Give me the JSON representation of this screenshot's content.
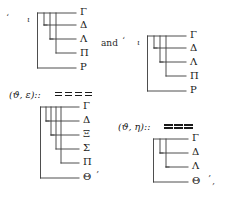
{
  "document": {
    "type": "mathematical-tree-diagrams",
    "conjunction": "and",
    "open_quote": "‘",
    "close_quote": "’",
    "trailing_comma": ",",
    "iota_symbol": "ι"
  },
  "formulas": [
    {
      "id": "theta-epsilon",
      "text": "(ϑ, ε)::",
      "relation_marks": 4,
      "relation_style": "spaced"
    },
    {
      "id": "theta-eta",
      "text": "(ϑ, η)::",
      "relation_marks": 3,
      "relation_style": "tight"
    }
  ],
  "trees": [
    {
      "id": "tree-top-left",
      "root_symbol": "ι",
      "leaves": [
        "Γ",
        "Δ",
        "Λ",
        "Π",
        "P"
      ],
      "depths": [
        0,
        1,
        2,
        3,
        4
      ]
    },
    {
      "id": "tree-top-right",
      "root_symbol": "ι",
      "leaves": [
        "Γ",
        "Δ",
        "Λ",
        "Π",
        "P"
      ],
      "depths": [
        0,
        1,
        2,
        3,
        4
      ]
    },
    {
      "id": "tree-bottom-left",
      "root_symbol": "",
      "leaves": [
        "Γ",
        "Δ",
        "Ξ",
        "Σ",
        "Π",
        "Θ"
      ],
      "depths": [
        0,
        1,
        2,
        3,
        4,
        5
      ]
    },
    {
      "id": "tree-bottom-right",
      "root_symbol": "",
      "leaves": [
        "Γ",
        "Δ",
        "Λ",
        "Θ"
      ],
      "depths": [
        0,
        1,
        2,
        3
      ]
    }
  ],
  "colors": {
    "ink": "#1a1a1a",
    "rule": "#3a3a3a",
    "background": "#ffffff"
  }
}
